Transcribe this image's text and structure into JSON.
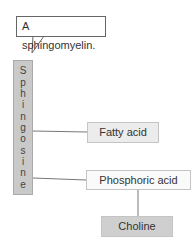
{
  "callout": {
    "text": "A sphingomyelin."
  },
  "backbone": {
    "label": "Sphingosine",
    "letters": [
      "S",
      "p",
      "h",
      "i",
      "n",
      "g",
      "o",
      "s",
      "i",
      "n",
      "e"
    ]
  },
  "nodes": {
    "fatty_acid": "Fatty acid",
    "phosphoric_acid": "Phosphoric acid",
    "choline": "Choline"
  },
  "colors": {
    "backbone": "#c9c9c9",
    "fatty_acid": "#ececec",
    "phosphoric_acid": "#fafafa",
    "choline": "#cfcfcf",
    "line": "#666666"
  }
}
